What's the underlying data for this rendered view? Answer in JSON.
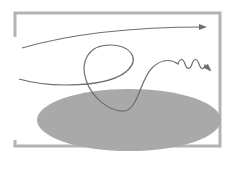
{
  "diagram": {
    "colors": {
      "frame": "#b3b3b3",
      "ellipse": "#a9a9a9",
      "curve": "#6e6e6e",
      "background": "#ffffff"
    },
    "elements": [
      {
        "type": "frame",
        "description": "partial rectangular frame with gaps on left side"
      },
      {
        "type": "ellipse",
        "description": "gray filled elliptical region"
      },
      {
        "type": "arrow-curve",
        "description": "smooth trajectory arrow along top"
      },
      {
        "type": "arrow-curve",
        "description": "looping trajectory ending in wavy segment with arrow"
      }
    ]
  }
}
